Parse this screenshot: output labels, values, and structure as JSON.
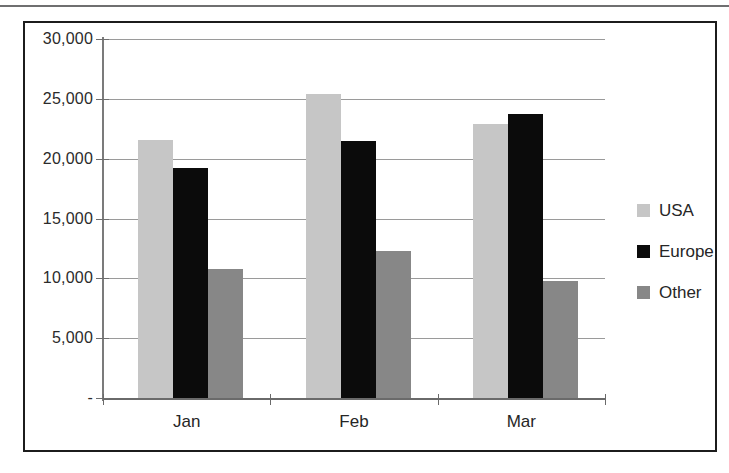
{
  "chart_data": {
    "type": "bar",
    "title": "",
    "subtitle": "",
    "xlabel": "",
    "ylabel": "",
    "categories": [
      "Jan",
      "Feb",
      "Mar"
    ],
    "series": [
      {
        "name": "USA",
        "color": "#c6c6c6",
        "values": [
          21600,
          25400,
          22900
        ]
      },
      {
        "name": "Europe",
        "color": "#0b0b0b",
        "values": [
          19200,
          21500,
          23700
        ]
      },
      {
        "name": "Other",
        "color": "#878787",
        "values": [
          10800,
          12300,
          9800
        ]
      }
    ],
    "ylim": [
      0,
      30000
    ],
    "y_ticks": [
      0,
      5000,
      10000,
      15000,
      20000,
      25000,
      30000
    ],
    "y_tick_labels": [
      "-",
      "5,000",
      "10,000",
      "15,000",
      "20,000",
      "25,000",
      "30,000"
    ],
    "grid": true,
    "legend_position": "right",
    "annotations": []
  },
  "legend": {
    "entries": [
      {
        "label": "USA"
      },
      {
        "label": "Europe"
      },
      {
        "label": "Other"
      }
    ]
  }
}
